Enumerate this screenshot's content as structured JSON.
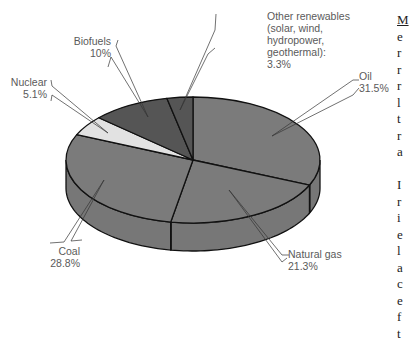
{
  "chart_data": {
    "type": "pie",
    "style": "3d",
    "title": "",
    "categories": [
      "Oil",
      "Natural gas",
      "Coal",
      "Nuclear",
      "Biofuels",
      "Other renewables (solar, wind, hydropower, geothermal)"
    ],
    "values": [
      31.5,
      21.3,
      28.8,
      5.1,
      10,
      3.3
    ],
    "unit": "%",
    "colors": [
      "#7b7b7b",
      "#7b7b7b",
      "#7b7b7b",
      "#e2e2e2",
      "#555555",
      "#555555"
    ],
    "start_angle": "12 o'clock",
    "direction": "clockwise",
    "legend": "none (callout labels)"
  },
  "labels": {
    "oil": {
      "name": "Oil",
      "value": "31.5%"
    },
    "natural_gas": {
      "name": "Natural gas",
      "value": "21.3%"
    },
    "coal": {
      "name": "Coal",
      "value": "28.8%"
    },
    "nuclear": {
      "name": "Nuclear",
      "value": "5.1%"
    },
    "biofuels": {
      "name": "Biofuels",
      "value": "10%"
    },
    "other": {
      "line1": "Other renewables",
      "line2": "(solar, wind,",
      "line3": "hydropower,",
      "line4": "geothermal):",
      "value": "3.3%"
    }
  },
  "side_text": {
    "lines": [
      "M",
      "e",
      "r",
      "r",
      "r",
      "l",
      "t",
      "r",
      "a",
      "",
      "I",
      "r",
      "i",
      "e",
      "l",
      "a",
      "c",
      "e",
      "f",
      "t"
    ]
  }
}
